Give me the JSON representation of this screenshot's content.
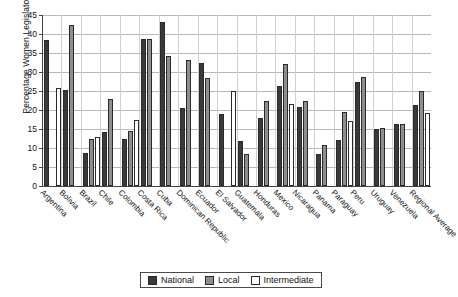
{
  "chart_data": {
    "type": "bar",
    "title": "",
    "xlabel": "",
    "ylabel": "Percentage Women Legislators",
    "ylim": [
      0,
      45
    ],
    "ytick_step": 5,
    "yticks": [
      0,
      5,
      10,
      15,
      20,
      25,
      30,
      35,
      40,
      45
    ],
    "grid": true,
    "legend_position": "bottom",
    "categories": [
      "Argentina",
      "Bolivia",
      "Brazil",
      "Chile",
      "Colombia",
      "Costa Rica",
      "Cuba",
      "Dominican Republic",
      "Ecuador",
      "El Salvador",
      "Guatemala",
      "Honduras",
      "Mexico",
      "Nicaragua",
      "Panama",
      "Paraguay",
      "Peru",
      "Uruguay",
      "Venezuela",
      "Regional Average"
    ],
    "series": [
      {
        "name": "National",
        "color": "#3a3a3a",
        "values": [
          38.5,
          25.3,
          8.7,
          14.1,
          12.4,
          38.6,
          43.2,
          20.6,
          32.3,
          19.0,
          11.9,
          17.8,
          26.2,
          20.7,
          8.5,
          12.0,
          27.5,
          14.9,
          16.4,
          21.3
        ]
      },
      {
        "name": "Local",
        "color": "#8e8e8e",
        "values": [
          null,
          42.5,
          12.3,
          23.0,
          14.4,
          38.6,
          34.2,
          33.2,
          28.5,
          null,
          8.5,
          22.4,
          32.0,
          22.5,
          10.8,
          19.5,
          28.7,
          15.3,
          16.4,
          24.9
        ]
      },
      {
        "name": "Intermediate",
        "color": "#ffffff",
        "values": [
          25.8,
          null,
          13.0,
          null,
          17.5,
          null,
          null,
          null,
          null,
          25.1,
          null,
          null,
          21.7,
          null,
          null,
          17.0,
          null,
          null,
          null,
          19.2
        ]
      }
    ]
  },
  "legend": {
    "items": [
      {
        "label": "National",
        "key": "national"
      },
      {
        "label": "Local",
        "key": "local"
      },
      {
        "label": "Intermediate",
        "key": "intermediate"
      }
    ]
  }
}
